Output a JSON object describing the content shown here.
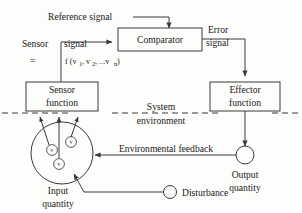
{
  "figure": {
    "type": "block-diagram",
    "background_color": "#fdfdfb",
    "line_color": "#3a3a3a",
    "text_color": "#1b1b1b"
  },
  "labels": {
    "reference_signal": "Reference signal",
    "comparator": "Comparator",
    "error_signal_line1": "Error",
    "error_signal_line2": "signal",
    "sensor_word": "Sensor",
    "signal_word": "signal",
    "equals_sign": "=",
    "formula_f": "f (v",
    "formula_sub1": "1",
    "formula_comma1": ", v",
    "formula_sub2": "2",
    "formula_mid": ", ...v",
    "formula_subn": "n",
    "formula_close": ")",
    "sensor_function_line1": "Sensor",
    "sensor_function_line2": "function",
    "effector_function_line1": "Effector",
    "effector_function_line2": "function",
    "system_environment_line1": "System",
    "system_environment_line2": "environment",
    "environmental_feedback": "Environmental feedback",
    "input_quantity_line1": "Input",
    "input_quantity_line2": "quantity",
    "output_quantity_line1": "Output",
    "output_quantity_line2": "quantity",
    "disturbance": "Disturbance",
    "variable_v1": "v",
    "variable_v2": "v",
    "variable_vn": "v"
  },
  "nodes": [
    {
      "id": "comparator",
      "label": "Comparator",
      "shape": "rect"
    },
    {
      "id": "sensor-function",
      "label": "Sensor function",
      "shape": "rect"
    },
    {
      "id": "effector-function",
      "label": "Effector function",
      "shape": "rect"
    },
    {
      "id": "input-quantity",
      "label": "Input quantity",
      "shape": "circle"
    },
    {
      "id": "output-quantity",
      "label": "Output quantity",
      "shape": "circle"
    },
    {
      "id": "disturbance",
      "label": "Disturbance",
      "shape": "circle"
    }
  ],
  "edges": [
    {
      "from": "reference-signal",
      "to": "comparator",
      "label": "Reference signal"
    },
    {
      "from": "sensor-function",
      "to": "comparator",
      "label": "Sensor signal = f (v1, v2, ...vn)"
    },
    {
      "from": "comparator",
      "to": "effector-function",
      "label": "Error signal"
    },
    {
      "from": "effector-function",
      "to": "output-quantity",
      "label": ""
    },
    {
      "from": "output-quantity",
      "to": "input-quantity",
      "label": "Environmental feedback"
    },
    {
      "from": "disturbance",
      "to": "input-quantity",
      "label": ""
    },
    {
      "from": "input-quantity",
      "to": "sensor-function",
      "label": ""
    }
  ],
  "boundary": {
    "style": "dashed",
    "label": "System environment"
  }
}
